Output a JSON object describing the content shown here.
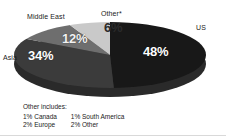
{
  "title_remnant": "",
  "chart_data": {
    "type": "pie",
    "title": "",
    "categories": [
      "US",
      "Asia",
      "Middle East",
      "Other*"
    ],
    "values": [
      48,
      34,
      12,
      6
    ],
    "value_labels": [
      "48%",
      "34%",
      "12%",
      "6%"
    ],
    "colors": [
      "#181818",
      "#3b3b3b",
      "#6e6e6e",
      "#c9c9c9"
    ],
    "side_color": "#2a2a2a",
    "style": "3d-pie",
    "legend": "callout-labels",
    "grid": false,
    "xlabel": "",
    "ylabel": "",
    "annotations": [
      "Other includes:",
      "1% Canada",
      "1% South America",
      "2% Europe",
      "2% Other"
    ]
  },
  "labels": {
    "us": "US",
    "asia": "Asia",
    "middle_east": "Middle East",
    "other": "Other*"
  },
  "percents": {
    "us": "48%",
    "asia": "34%",
    "middle_east": "12%",
    "other": "6%"
  },
  "footnote": {
    "heading": "Other includes:",
    "row1": {
      "a": "1%  Canada",
      "b": "1%  South America"
    },
    "row2": {
      "a": "2%  Europe",
      "b": "2%  Other"
    }
  }
}
